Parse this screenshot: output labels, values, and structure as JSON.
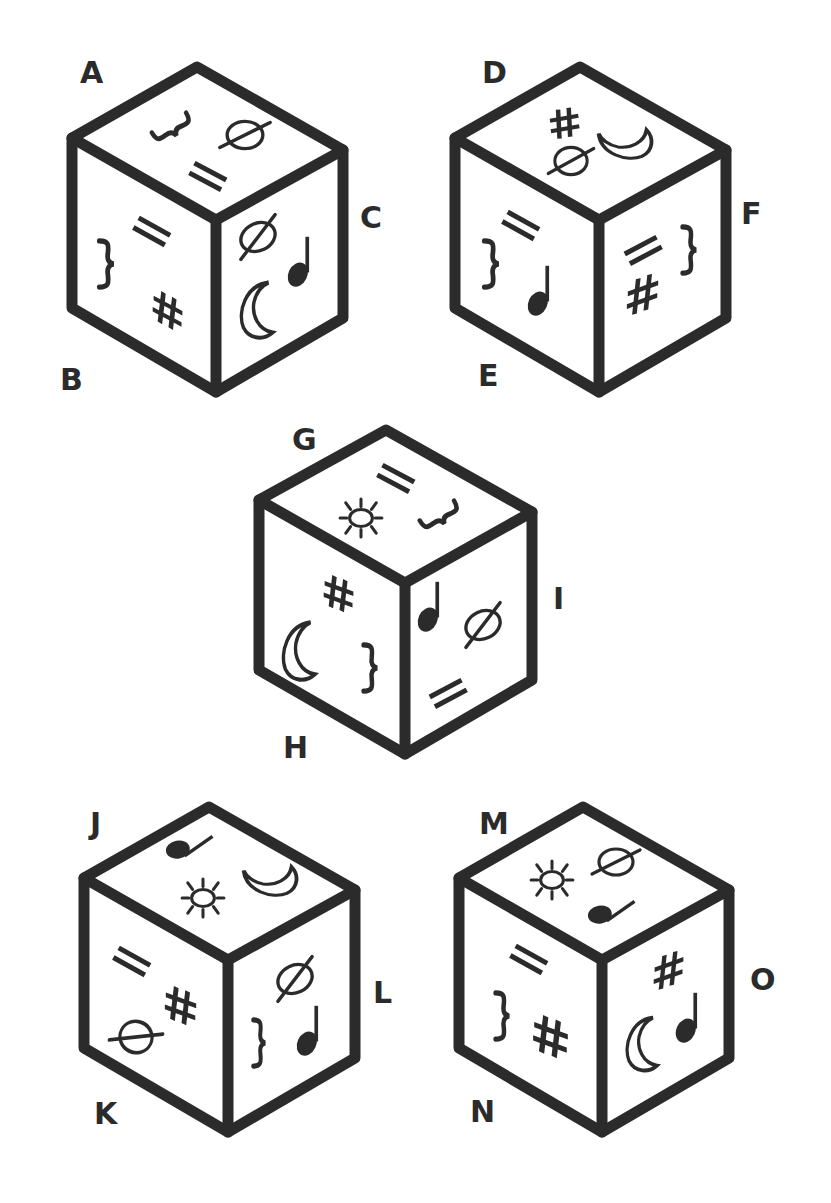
{
  "symbols_legend": {
    "slashed-circle": "ellipse with diagonal line (Ø)",
    "double-bar": "two parallel bars (=)",
    "brace": "curly brace (})",
    "hash": "hash / sharp sign (#)",
    "moon": "crescent moon outline",
    "note": "quarter music note (♩)",
    "sun": "sun with rays"
  },
  "cubes": [
    {
      "id": "cube-1",
      "labels": {
        "top": "A",
        "left": "B",
        "right": "C"
      },
      "faces": {
        "top": [
          "brace",
          "slashed-circle",
          "double-bar"
        ],
        "left": [
          "double-bar",
          "brace",
          "hash"
        ],
        "right": [
          "slashed-circle",
          "note",
          "moon"
        ]
      }
    },
    {
      "id": "cube-2",
      "labels": {
        "top": "D",
        "left": "E",
        "right": "F"
      },
      "faces": {
        "top": [
          "hash",
          "slashed-circle",
          "moon"
        ],
        "left": [
          "double-bar",
          "brace",
          "note"
        ],
        "right": [
          "double-bar",
          "brace",
          "hash"
        ]
      }
    },
    {
      "id": "cube-3",
      "labels": {
        "top": "G",
        "left": "H",
        "right": "I"
      },
      "faces": {
        "top": [
          "double-bar",
          "sun",
          "brace"
        ],
        "left": [
          "hash",
          "moon",
          "brace"
        ],
        "right": [
          "note",
          "slashed-circle",
          "double-bar"
        ]
      }
    },
    {
      "id": "cube-4",
      "labels": {
        "top": "J",
        "left": "K",
        "right": "L"
      },
      "faces": {
        "top": [
          "note",
          "sun",
          "moon"
        ],
        "left": [
          "double-bar",
          "hash",
          "slashed-circle"
        ],
        "right": [
          "slashed-circle",
          "brace",
          "note"
        ]
      }
    },
    {
      "id": "cube-5",
      "labels": {
        "top": "M",
        "left": "N",
        "right": "O"
      },
      "faces": {
        "top": [
          "sun",
          "slashed-circle",
          "note"
        ],
        "left": [
          "double-bar",
          "brace",
          "hash"
        ],
        "right": [
          "hash",
          "moon",
          "note"
        ]
      }
    }
  ]
}
